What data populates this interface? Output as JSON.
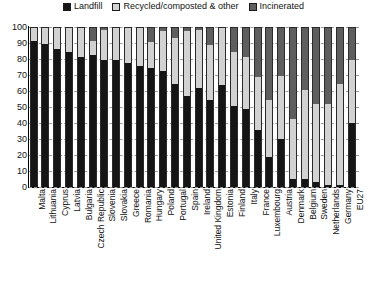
{
  "chart_data": {
    "type": "bar",
    "subtype": "stacked-bar-100",
    "title": "",
    "xlabel": "",
    "ylabel": "",
    "ylim": [
      0,
      100
    ],
    "yticks": [
      0,
      10,
      20,
      30,
      40,
      50,
      60,
      70,
      80,
      90,
      100
    ],
    "grid": true,
    "grid_style": "dashed-horizontal",
    "legend_position": "top-center",
    "legend": [
      "Landfill",
      "Recycled/composted & other",
      "Incinerated"
    ],
    "colors": {
      "landfill": "#151515",
      "recycled": "#d2d2d2",
      "incinerated": "#5e5e5e"
    },
    "categories": [
      "Malta",
      "Lithuania",
      "Cyprus",
      "Latvia",
      "Bulgaria",
      "Czech Republic",
      "Slovenia",
      "Slovakia",
      "Greece",
      "Romania",
      "Hungary",
      "Poland",
      "Portugal",
      "Spain",
      "Ireland",
      "United Kingdom",
      "Estonia",
      "Finland",
      "Italy",
      "France",
      "Luxembourg",
      "Austria",
      "Denmark",
      "Belgium",
      "Sweden",
      "Netherlands",
      "Germany",
      "EU27"
    ],
    "series": [
      {
        "name": "Landfill",
        "values": [
          92,
          90,
          87,
          85,
          82,
          83,
          80,
          80,
          78,
          76,
          75,
          73,
          65,
          57,
          62,
          55,
          64,
          51,
          49,
          36,
          19,
          30,
          5,
          5,
          3,
          1,
          1,
          40
        ]
      },
      {
        "name": "Recycled/composted & other",
        "values": [
          8,
          10,
          13,
          15,
          18,
          9,
          19,
          20,
          22,
          24,
          16,
          25,
          29,
          41,
          37,
          34,
          36,
          34,
          33,
          33,
          36,
          40,
          38,
          56,
          49,
          51,
          64,
          40
        ]
      },
      {
        "name": "Incinerated",
        "values": [
          0,
          0,
          0,
          0,
          0,
          8,
          1,
          0,
          0,
          0,
          9,
          2,
          6,
          2,
          1,
          11,
          0,
          15,
          18,
          31,
          45,
          30,
          57,
          39,
          48,
          48,
          35,
          20
        ]
      }
    ]
  }
}
